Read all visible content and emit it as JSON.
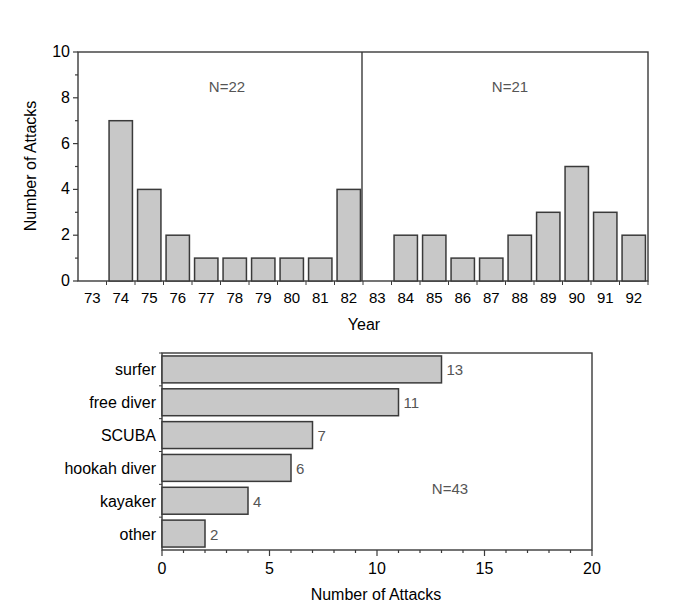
{
  "chart_data": [
    {
      "type": "bar",
      "title": "",
      "xlabel": "Year",
      "ylabel": "Number of Attacks",
      "ylim": [
        0,
        10
      ],
      "yticks": [
        0,
        2,
        4,
        6,
        8,
        10
      ],
      "grid": false,
      "categories": [
        "73",
        "74",
        "75",
        "76",
        "77",
        "78",
        "79",
        "80",
        "81",
        "82",
        "83",
        "84",
        "85",
        "86",
        "87",
        "88",
        "89",
        "90",
        "91",
        "92"
      ],
      "values": [
        0,
        7,
        4,
        2,
        1,
        1,
        1,
        1,
        1,
        4,
        0,
        2,
        2,
        1,
        1,
        2,
        3,
        5,
        3,
        2
      ],
      "panels": [
        {
          "range": [
            "73",
            "82"
          ],
          "annotation": "N=22"
        },
        {
          "range": [
            "83",
            "92"
          ],
          "annotation": "N=21"
        }
      ]
    },
    {
      "type": "bar",
      "orientation": "horizontal",
      "title": "",
      "xlabel": "Number of Attacks",
      "ylabel": "",
      "xlim": [
        0,
        20
      ],
      "xticks": [
        0,
        5,
        10,
        15,
        20
      ],
      "grid": false,
      "categories": [
        "surfer",
        "free diver",
        "SCUBA",
        "hookah diver",
        "kayaker",
        "other"
      ],
      "values": [
        13,
        11,
        7,
        6,
        4,
        2
      ],
      "data_labels": [
        "13",
        "11",
        "7",
        "6",
        "4",
        "2"
      ],
      "annotation": "N=43"
    }
  ],
  "top": {
    "ylabel": "Number of Attacks",
    "xlabel": "Year",
    "yticks": [
      "0",
      "2",
      "4",
      "6",
      "8",
      "10"
    ],
    "years": [
      "73",
      "74",
      "75",
      "76",
      "77",
      "78",
      "79",
      "80",
      "81",
      "82",
      "83",
      "84",
      "85",
      "86",
      "87",
      "88",
      "89",
      "90",
      "91",
      "92"
    ],
    "n_left": "N=22",
    "n_right": "N=21"
  },
  "bottom": {
    "xlabel": "Number of Attacks",
    "xticks": [
      "0",
      "5",
      "10",
      "15",
      "20"
    ],
    "categories": [
      "surfer",
      "free diver",
      "SCUBA",
      "hookah diver",
      "kayaker",
      "other"
    ],
    "labels": [
      "13",
      "11",
      "7",
      "6",
      "4",
      "2"
    ],
    "n_total": "N=43"
  },
  "colors": {
    "bar_fill": "#c8c8c8",
    "bar_stroke": "#3a3a3a",
    "axis": "#3a3a3a",
    "annotation": "#555555"
  }
}
